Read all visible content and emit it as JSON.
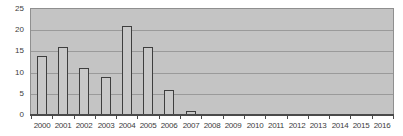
{
  "figure": {
    "title": "",
    "kind": "embedded-bar-chart"
  },
  "colors": {
    "page_bg": "#ffffff",
    "plot_bg": "#c4c4c4",
    "plot_border": "#8f8f8f",
    "gridline": "#9a9a9a",
    "axis_line": "#4a4a4a",
    "tick": "#4a4a4a",
    "bar_fill": "#c8c8c8",
    "bar_border": "#3e3e3e",
    "text": "#3c3c3c"
  },
  "chart_data": {
    "type": "bar",
    "categories": [
      "2000",
      "2001",
      "2002",
      "2003",
      "2004",
      "2005",
      "2006",
      "2007",
      "2008",
      "2009",
      "2010",
      "2011",
      "2012",
      "2013",
      "2014",
      "2015",
      "2016"
    ],
    "values": [
      14,
      16,
      11,
      9,
      21,
      16,
      6,
      1,
      0,
      0,
      0,
      0,
      0,
      0,
      0,
      0,
      0
    ],
    "title": "",
    "xlabel": "",
    "ylabel": "",
    "ylim": [
      0,
      25
    ],
    "yticks": [
      0,
      5,
      10,
      15,
      20,
      25
    ],
    "grid": true,
    "legend": false
  }
}
